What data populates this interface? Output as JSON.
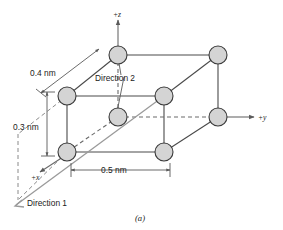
{
  "figure": {
    "caption": "(a)",
    "axes": [
      {
        "name": "z-axis",
        "label": "+z"
      },
      {
        "name": "y-axis",
        "label": "+y"
      },
      {
        "name": "x-axis",
        "label": "+x"
      }
    ],
    "dimensions": [
      {
        "name": "edge-x",
        "label": "0.4 nm"
      },
      {
        "name": "edge-z",
        "label": "0.3 nm"
      },
      {
        "name": "edge-y",
        "label": "0.5 nm"
      }
    ],
    "annotations": [
      {
        "name": "direction-1",
        "label": "Direction 1"
      },
      {
        "name": "direction-2",
        "label": "Direction 2"
      }
    ],
    "colors": {
      "atom_fill": "#d4d4d4",
      "atom_stroke": "#3a3a3a",
      "line": "#4a4a4a",
      "dashed": "#6a6a6a",
      "direction": "#9a9a9a",
      "background": "#ffffff"
    },
    "atoms": [
      {
        "name": "atom-top-back-left",
        "cx": 118,
        "cy": 55,
        "r": 9
      },
      {
        "name": "atom-top-back-right",
        "cx": 218,
        "cy": 55,
        "r": 9
      },
      {
        "name": "atom-top-front-left",
        "cx": 67,
        "cy": 96,
        "r": 9
      },
      {
        "name": "atom-top-front-right",
        "cx": 164,
        "cy": 96,
        "r": 9
      },
      {
        "name": "atom-origin",
        "cx": 118,
        "cy": 117,
        "r": 9
      },
      {
        "name": "atom-mid-back-right",
        "cx": 218,
        "cy": 117,
        "r": 9
      },
      {
        "name": "atom-bottom-left",
        "cx": 67,
        "cy": 152,
        "r": 9
      },
      {
        "name": "atom-bottom-right",
        "cx": 164,
        "cy": 152,
        "r": 9
      }
    ]
  }
}
